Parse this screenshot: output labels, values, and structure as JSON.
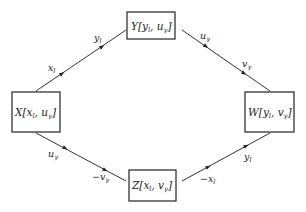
{
  "diagram": {
    "nodes": {
      "Y": {
        "label": "Y",
        "args": [
          {
            "v": "y",
            "s": "l"
          },
          {
            "v": "u",
            "s": "γ"
          }
        ]
      },
      "X": {
        "label": "X",
        "args": [
          {
            "v": "x",
            "s": "l"
          },
          {
            "v": "u",
            "s": "γ"
          }
        ]
      },
      "W": {
        "label": "W",
        "args": [
          {
            "v": "y",
            "s": "l"
          },
          {
            "v": "v",
            "s": "γ"
          }
        ]
      },
      "Z": {
        "label": "Z",
        "args": [
          {
            "v": "x",
            "s": "l"
          },
          {
            "v": "v",
            "s": "γ"
          }
        ]
      }
    },
    "edges": {
      "XY": {
        "near_X": {
          "pre": "",
          "v": "x",
          "s": "l"
        },
        "near_Y": {
          "pre": "",
          "v": "y",
          "s": "l"
        }
      },
      "YW": {
        "near_Y": {
          "pre": "",
          "v": "u",
          "s": "γ"
        },
        "near_W": {
          "pre": "",
          "v": "v",
          "s": "γ"
        }
      },
      "XZ": {
        "near_X": {
          "pre": "",
          "v": "u",
          "s": "γ"
        },
        "near_Z": {
          "pre": "−",
          "v": "v",
          "s": "γ"
        }
      },
      "ZW": {
        "near_Z": {
          "pre": "−",
          "v": "x",
          "s": "l"
        },
        "near_W": {
          "pre": "",
          "v": "y",
          "s": "l"
        }
      }
    }
  }
}
